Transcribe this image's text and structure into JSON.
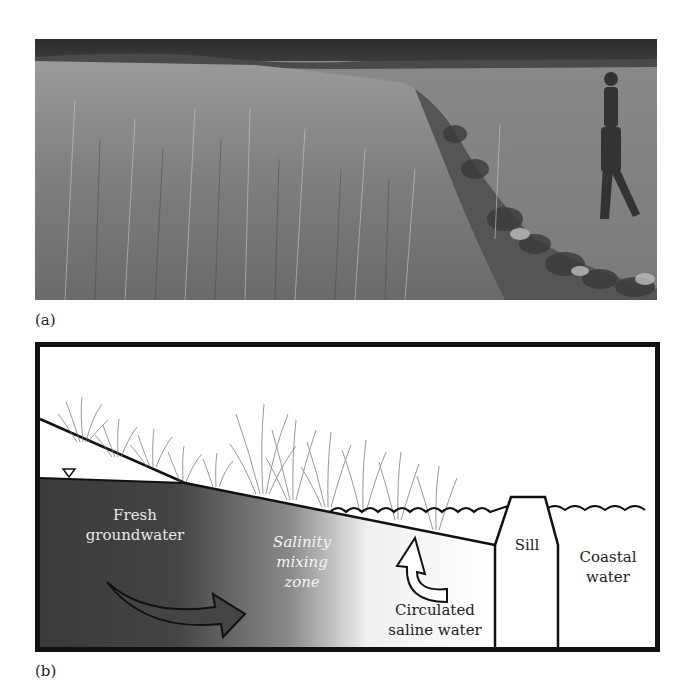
{
  "figure": {
    "panel_a": {
      "label": "(a)",
      "image_description": "Photograph of tall marsh grass along a rock sill shoreline with a person wading near the water"
    },
    "panel_b": {
      "label": "(b)",
      "labels": {
        "fresh_groundwater_line1": "Fresh",
        "fresh_groundwater_line2": "groundwater",
        "salinity_line1": "Salinity",
        "salinity_line2": "mixing",
        "salinity_line3": "zone",
        "circulated_line1": "Circulated",
        "circulated_line2": "saline water",
        "sill": "Sill",
        "coastal_line1": "Coastal",
        "coastal_line2": "water"
      },
      "water_table_symbol": "▽"
    }
  },
  "colors": {
    "groundwater_dark": "#3a3a3a",
    "mixing_light": "#f2f2f2",
    "line": "#111111",
    "grass": "#777777",
    "label_light": "#e8e8e8",
    "label_dark": "#222222"
  }
}
